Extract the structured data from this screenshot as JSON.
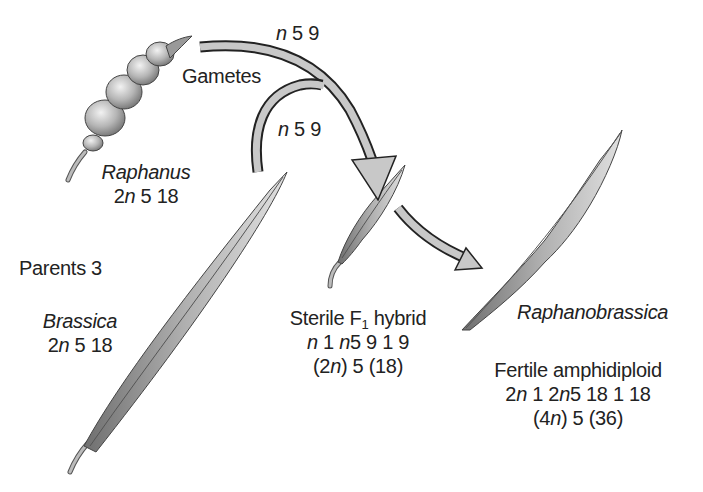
{
  "diagram": {
    "type": "hybridization-flow",
    "labels": {
      "gametes": "Gametes",
      "gamete_top_n": "n",
      "gamete_top_val": "5 9",
      "gamete_bottom_n": "n",
      "gamete_bottom_val": "5 9",
      "parents": "Parents 3"
    },
    "parents": [
      {
        "name": "Raphanus",
        "prefix": "2",
        "n": "n",
        "value": "5 18"
      },
      {
        "name": "Brassica",
        "prefix": "2",
        "n": "n",
        "value": "5 18"
      }
    ],
    "f1": {
      "title_pre": "Sterile F",
      "title_sub": "1",
      "title_post": " hybrid",
      "line2_n1": "n",
      "line2_mid": " 1 ",
      "line2_n2": "n",
      "line2_val": "5 9 1 9",
      "line3_pre": "(2",
      "line3_n": "n",
      "line3_post": ") 5 (18)"
    },
    "amphidiploid": {
      "name": "Raphanobrassica",
      "title": "Fertile amphidiploid",
      "line2_a": "2",
      "line2_n1": "n",
      "line2_b": " 1 2",
      "line2_n2": "n",
      "line2_c": "5 18 1 18",
      "line3_pre": "(4",
      "line3_n": "n",
      "line3_post": ") 5 (36)"
    },
    "colors": {
      "arrow_fill": "#c8c8c8",
      "arrow_stroke": "#222222",
      "pod_dark": "#7a7a7a",
      "pod_light": "#d6d6d6"
    }
  }
}
